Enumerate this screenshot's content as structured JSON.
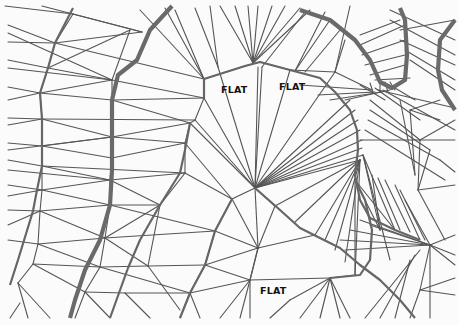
{
  "figure": {
    "labels": [
      {
        "text": "FLAT",
        "x": 221,
        "y": 84
      },
      {
        "text": "FLAT",
        "x": 279,
        "y": 81
      },
      {
        "text": "FLAT",
        "x": 260,
        "y": 285
      }
    ],
    "colors": {
      "line": "#555555",
      "contour": "#666666",
      "background": "#fbfbfb",
      "label": "#111111"
    }
  }
}
